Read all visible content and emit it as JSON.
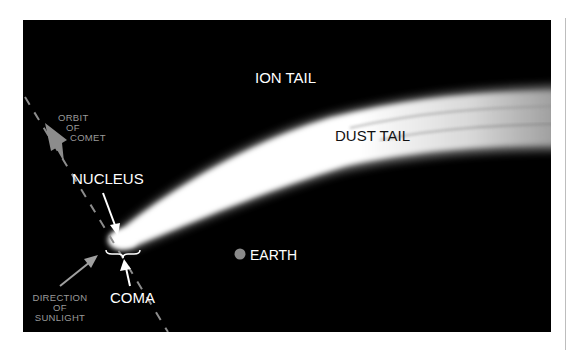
{
  "diagram": {
    "labels": {
      "ion_tail": "ION TAIL",
      "dust_tail": "DUST TAIL",
      "nucleus": "NUCLEUS",
      "coma": "COMA",
      "earth": "EARTH",
      "orbit": [
        "ORBIT",
        "OF",
        "COMET"
      ],
      "sunlight": [
        "DIRECTION",
        "OF",
        "SUNLIGHT"
      ]
    },
    "colors": {
      "background": "#000000",
      "tail": "#ffffff",
      "earth": "#8a8a8a",
      "orbit_arrow": "#8c8c8c",
      "grey_text": "#9a9a9a"
    }
  }
}
